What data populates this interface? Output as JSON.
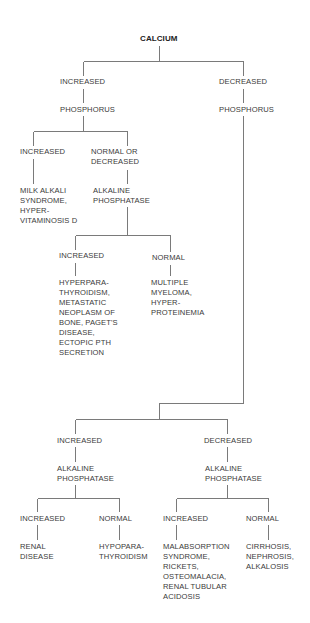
{
  "diagram": {
    "root": {
      "label": "CALCIUM"
    },
    "left": {
      "calcium_level": "INCREASED",
      "test": "PHOSPHORUS",
      "phos_increased": {
        "label": "INCREASED",
        "result": "MILK ALKALI\nSYNDROME,\nHYPER-\nVITAMINOSIS D"
      },
      "phos_normal_or_decreased": {
        "label": "NORMAL OR\nDECREASED",
        "test": "ALKALINE\nPHOSPHATASE",
        "alp_increased": {
          "label": "INCREASED",
          "result": "HYPERPARA-\nTHYROIDISM,\nMETASTATIC\nNEOPLASM OF\nBONE, PAGET'S\nDISEASE,\nECTOPIC PTH\nSECRETION"
        },
        "alp_normal": {
          "label": "NORMAL",
          "result": "MULTIPLE\nMYELOMA,\nHYPER-\nPROTEINEMIA"
        }
      }
    },
    "right": {
      "calcium_level": "DECREASED",
      "test": "PHOSPHORUS",
      "phos_increased": {
        "label": "INCREASED",
        "test": "ALKALINE\nPHOSPHATASE",
        "alp_increased": {
          "label": "INCREASED",
          "result": "RENAL\nDISEASE"
        },
        "alp_normal": {
          "label": "NORMAL",
          "result": "HYPOPARA-\nTHYROIDISM"
        }
      },
      "phos_decreased": {
        "label": "DECREASED",
        "test": "ALKALINE\nPHOSPHATASE",
        "alp_increased": {
          "label": "INCREASED",
          "result": "MALABSORPTION\nSYNDROME,\nRICKETS,\nOSTEOMALACIA,\nRENAL TUBULAR\nACIDOSIS"
        },
        "alp_normal": {
          "label": "NORMAL",
          "result": "CIRRHOSIS,\nNEPHROSIS,\nALKALOSIS"
        }
      }
    }
  },
  "colors": {
    "text": "#3a3a3a",
    "lines": "#7a7a7a",
    "background": "#ffffff"
  }
}
